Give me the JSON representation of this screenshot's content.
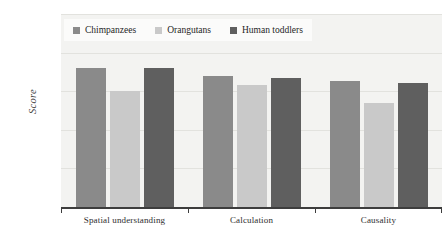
{
  "chart_data": {
    "type": "bar",
    "title": "",
    "xlabel": "",
    "ylabel": "Score",
    "ylim": [
      0,
      1
    ],
    "yticks": [
      "0.2",
      "0.4",
      "0.6",
      "0.8",
      "1"
    ],
    "ytick_values": [
      0.2,
      0.4,
      0.6,
      0.8,
      1
    ],
    "grid": true,
    "legend_position": "top-left",
    "categories": [
      "Spatial understanding",
      "Calculation",
      "Causality"
    ],
    "series": [
      {
        "name": "Chimpanzees",
        "color": "#8a8a8a",
        "values": [
          0.72,
          0.68,
          0.655
        ]
      },
      {
        "name": "Orangutans",
        "color": "#c9c9c9",
        "values": [
          0.6,
          0.63,
          0.54
        ]
      },
      {
        "name": "Human toddlers",
        "color": "#5f5f5f",
        "values": [
          0.72,
          0.67,
          0.645
        ]
      }
    ]
  },
  "style": {
    "plot_background": "#f3f3f1",
    "grid_color": "#e2e2de",
    "axis_color": "#3d3d3d",
    "legend_background": "#fbfbfa",
    "page_background": "#ffffff"
  }
}
